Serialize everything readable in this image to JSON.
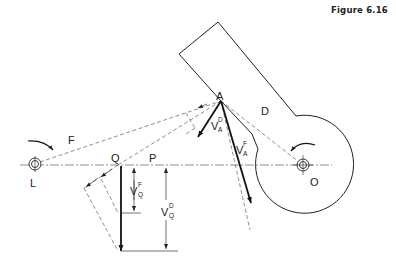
{
  "figure": {
    "title": "Figure 6.16"
  },
  "labels": {
    "L": "L",
    "O": "O",
    "A": "A",
    "D": "D",
    "F": "F",
    "Q": "Q",
    "P": "P"
  },
  "vectors": {
    "VAD": {
      "main": "V",
      "sup": "D",
      "sub": "A"
    },
    "VAF": {
      "main": "V",
      "sup": "F",
      "sub": "A"
    },
    "VQF": {
      "main": "V",
      "sup": "F",
      "sub": "Q"
    },
    "VQD": {
      "main": "V",
      "sup": "D",
      "sub": "Q"
    }
  },
  "colors": {
    "ink": "#222222",
    "background": "#ffffff"
  }
}
